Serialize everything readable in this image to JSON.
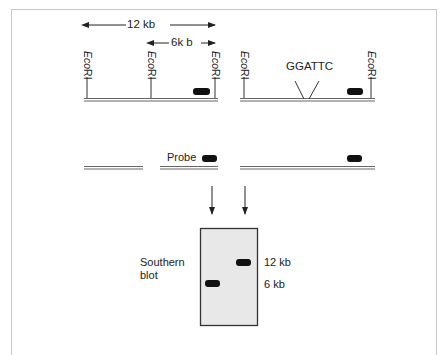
{
  "diagram": {
    "type": "southern-blot-restriction-map",
    "scale_labels": {
      "large": "12 kb",
      "small": "6k b"
    },
    "enzyme_site": {
      "prefix": "Eco",
      "suffix": "RI"
    },
    "mutation_site": "GGATTC",
    "probe_label": "Probe",
    "blot": {
      "title_line1": "Southern",
      "title_line2": "blot",
      "band_labels": [
        "12 kb",
        "6 kb"
      ]
    },
    "colors": {
      "line": "#555555",
      "band": "#111111",
      "membrane": "#e8e8e8",
      "frame": "#c8c8c8"
    }
  }
}
